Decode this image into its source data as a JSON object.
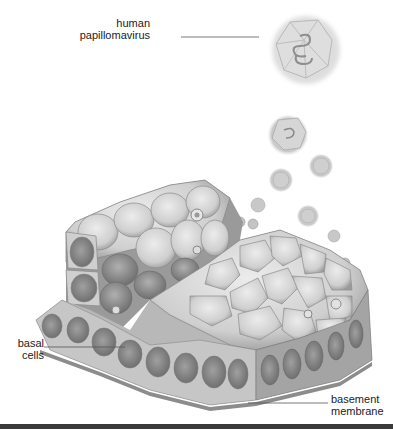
{
  "figure": {
    "labels": {
      "virus_line1": "human",
      "virus_line2": "papillomavirus",
      "basal_line1": "basal",
      "basal_line2": "cells",
      "membrane_line1": "basement",
      "membrane_line2": "membrane"
    },
    "colors": {
      "background": "#ffffff",
      "tissue_light": "#d8d8d8",
      "tissue_mid": "#a8a8a8",
      "tissue_dark": "#707070",
      "leader_line": "#555555",
      "bottom_rule": "#3a3a3a"
    }
  }
}
